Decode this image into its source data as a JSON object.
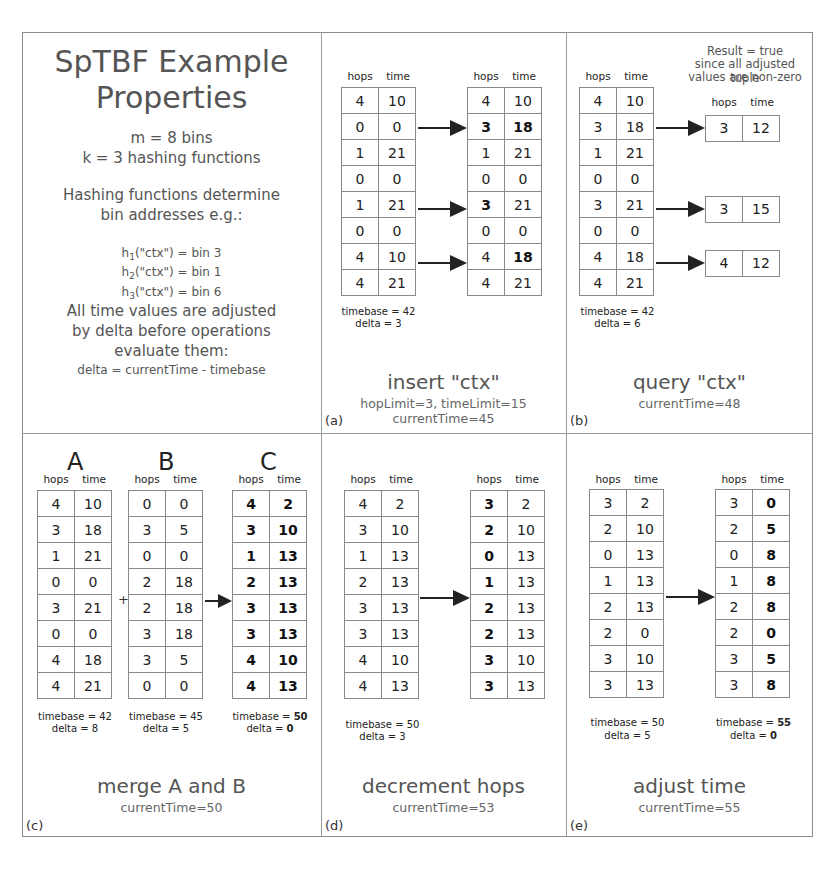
{
  "properties": {
    "title_line1": "SpTBF Example",
    "title_line2": "Properties",
    "m_line": "m = 8 bins",
    "k_line": "k = 3 hashing functions",
    "hash_desc_line1": "Hashing functions determine",
    "hash_desc_line2": "bin addresses e.g.:",
    "hashes": [
      {
        "fn": "h",
        "sub": "1",
        "expr": "(\"ctx\") = bin 3"
      },
      {
        "fn": "h",
        "sub": "2",
        "expr": "(\"ctx\") = bin 1"
      },
      {
        "fn": "h",
        "sub": "3",
        "expr": "(\"ctx\") = bin 6"
      }
    ],
    "delta_desc_line1": "All time values are adjusted",
    "delta_desc_line2": "by delta before operations",
    "delta_desc_line3": "evaluate them:",
    "delta_formula": "delta = currentTime - timebase"
  },
  "headers": {
    "hops": "hops",
    "time": "time"
  },
  "panels": {
    "a": {
      "label": "(a)",
      "title": "insert \"ctx\"",
      "sub1": "hopLimit=3, timeLimit=15",
      "sub2": "currentTime=45",
      "before": {
        "rows": [
          [
            4,
            10
          ],
          [
            0,
            0
          ],
          [
            1,
            21
          ],
          [
            0,
            0
          ],
          [
            1,
            21
          ],
          [
            0,
            0
          ],
          [
            4,
            10
          ],
          [
            4,
            21
          ]
        ],
        "timebase": "timebase = 42",
        "delta": "delta = 3"
      },
      "after": {
        "rows": [
          [
            4,
            10
          ],
          [
            3,
            18
          ],
          [
            1,
            21
          ],
          [
            0,
            0
          ],
          [
            3,
            21
          ],
          [
            0,
            0
          ],
          [
            4,
            18
          ],
          [
            4,
            21
          ]
        ],
        "bold": [
          [
            1,
            0
          ],
          [
            1,
            1
          ],
          [
            4,
            0
          ],
          [
            6,
            1
          ]
        ]
      },
      "arrow_rows": [
        1,
        4,
        6
      ]
    },
    "b": {
      "label": "(b)",
      "title": "query \"ctx\"",
      "sub1": "currentTime=48",
      "result_line1": "Result = true",
      "result_line2": "since all adjusted tuple",
      "result_line3": "values are non-zero",
      "table": {
        "rows": [
          [
            4,
            10
          ],
          [
            3,
            18
          ],
          [
            1,
            21
          ],
          [
            0,
            0
          ],
          [
            3,
            21
          ],
          [
            0,
            0
          ],
          [
            4,
            18
          ],
          [
            4,
            21
          ]
        ],
        "timebase": "timebase = 42",
        "delta": "delta = 6"
      },
      "results": [
        {
          "row": 1,
          "hops": 3,
          "time": 12
        },
        {
          "row": 4,
          "hops": 3,
          "time": 15
        },
        {
          "row": 6,
          "hops": 4,
          "time": 12
        }
      ]
    },
    "c": {
      "label": "(c)",
      "title": "merge A and B",
      "sub1": "currentTime=50",
      "plus": "+",
      "A": {
        "name": "A",
        "rows": [
          [
            4,
            10
          ],
          [
            3,
            18
          ],
          [
            1,
            21
          ],
          [
            0,
            0
          ],
          [
            3,
            21
          ],
          [
            0,
            0
          ],
          [
            4,
            18
          ],
          [
            4,
            21
          ]
        ],
        "timebase": "timebase = 42",
        "delta": "delta = 8"
      },
      "B": {
        "name": "B",
        "rows": [
          [
            0,
            0
          ],
          [
            3,
            5
          ],
          [
            0,
            0
          ],
          [
            2,
            18
          ],
          [
            2,
            18
          ],
          [
            3,
            18
          ],
          [
            3,
            5
          ],
          [
            0,
            0
          ]
        ],
        "timebase": "timebase = 45",
        "delta": "delta = 5"
      },
      "C": {
        "name": "C",
        "rows": [
          [
            4,
            2
          ],
          [
            3,
            10
          ],
          [
            1,
            13
          ],
          [
            2,
            13
          ],
          [
            3,
            13
          ],
          [
            3,
            13
          ],
          [
            4,
            10
          ],
          [
            4,
            13
          ]
        ],
        "timebase_label": "timebase = ",
        "timebase_value": "50",
        "delta_label": "delta = ",
        "delta_value": "0"
      }
    },
    "d": {
      "label": "(d)",
      "title": "decrement hops",
      "sub1": "currentTime=53",
      "before": {
        "rows": [
          [
            4,
            2
          ],
          [
            3,
            10
          ],
          [
            1,
            13
          ],
          [
            2,
            13
          ],
          [
            3,
            13
          ],
          [
            3,
            13
          ],
          [
            4,
            10
          ],
          [
            4,
            13
          ]
        ],
        "timebase": "timebase = 50",
        "delta": "delta = 3"
      },
      "after": {
        "rows": [
          [
            3,
            2
          ],
          [
            2,
            10
          ],
          [
            0,
            13
          ],
          [
            1,
            13
          ],
          [
            2,
            13
          ],
          [
            2,
            13
          ],
          [
            3,
            10
          ],
          [
            3,
            13
          ]
        ]
      }
    },
    "e": {
      "label": "(e)",
      "title": "adjust time",
      "sub1": "currentTime=55",
      "before": {
        "rows": [
          [
            3,
            2
          ],
          [
            2,
            10
          ],
          [
            0,
            13
          ],
          [
            1,
            13
          ],
          [
            2,
            13
          ],
          [
            2,
            0
          ],
          [
            3,
            10
          ],
          [
            3,
            13
          ]
        ],
        "timebase": "timebase = 50",
        "delta": "delta = 5"
      },
      "after": {
        "rows": [
          [
            3,
            0
          ],
          [
            2,
            5
          ],
          [
            0,
            8
          ],
          [
            1,
            8
          ],
          [
            2,
            8
          ],
          [
            2,
            0
          ],
          [
            3,
            5
          ],
          [
            3,
            8
          ]
        ],
        "timebase_label": "timebase = ",
        "timebase_value": "55",
        "delta_label": "delta = ",
        "delta_value": "0"
      }
    }
  }
}
